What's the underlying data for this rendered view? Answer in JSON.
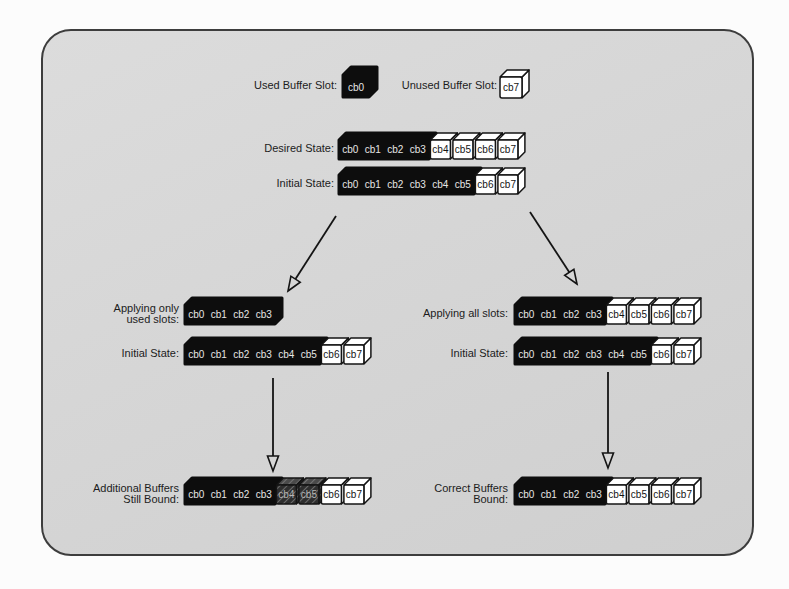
{
  "legend": {
    "used_label": "Used Buffer Slot:",
    "used_slot": "cb0",
    "unused_label": "Unused Buffer Slot:",
    "unused_slot": "cb7"
  },
  "rows": [
    {
      "id": "desired-state",
      "label_lines": [
        "Desired State:"
      ],
      "segments": [
        {
          "type": "used",
          "slots": [
            "cb0",
            "cb1",
            "cb2",
            "cb3"
          ]
        },
        {
          "type": "unused",
          "slots": [
            "cb4",
            "cb5",
            "cb6",
            "cb7"
          ]
        }
      ]
    },
    {
      "id": "initial-state-top",
      "label_lines": [
        "Initial State:"
      ],
      "segments": [
        {
          "type": "used",
          "slots": [
            "cb0",
            "cb1",
            "cb2",
            "cb3",
            "cb4",
            "cb5"
          ]
        },
        {
          "type": "unused",
          "slots": [
            "cb6",
            "cb7"
          ]
        }
      ]
    },
    {
      "id": "applying-only-used",
      "label_lines": [
        "Applying only",
        "used slots:"
      ],
      "segments": [
        {
          "type": "used",
          "slots": [
            "cb0",
            "cb1",
            "cb2",
            "cb3"
          ]
        }
      ]
    },
    {
      "id": "initial-state-left",
      "label_lines": [
        "Initial State:"
      ],
      "segments": [
        {
          "type": "used",
          "slots": [
            "cb0",
            "cb1",
            "cb2",
            "cb3",
            "cb4",
            "cb5"
          ]
        },
        {
          "type": "unused",
          "slots": [
            "cb6",
            "cb7"
          ]
        }
      ]
    },
    {
      "id": "additional-buffers-still-bound",
      "label_lines": [
        "Additional Buffers",
        "Still Bound:"
      ],
      "segments": [
        {
          "type": "used",
          "slots": [
            "cb0",
            "cb1",
            "cb2",
            "cb3"
          ]
        },
        {
          "type": "hatched",
          "slots": [
            "cb4",
            "cb5"
          ]
        },
        {
          "type": "unused",
          "slots": [
            "cb6",
            "cb7"
          ]
        }
      ]
    },
    {
      "id": "applying-all-slots",
      "label_lines": [
        "Applying all slots:"
      ],
      "segments": [
        {
          "type": "used",
          "slots": [
            "cb0",
            "cb1",
            "cb2",
            "cb3"
          ]
        },
        {
          "type": "unused",
          "slots": [
            "cb4",
            "cb5",
            "cb6",
            "cb7"
          ]
        }
      ]
    },
    {
      "id": "initial-state-right",
      "label_lines": [
        "Initial State:"
      ],
      "segments": [
        {
          "type": "used",
          "slots": [
            "cb0",
            "cb1",
            "cb2",
            "cb3",
            "cb4",
            "cb5"
          ]
        },
        {
          "type": "unused",
          "slots": [
            "cb6",
            "cb7"
          ]
        }
      ]
    },
    {
      "id": "correct-buffers-bound",
      "label_lines": [
        "Correct Buffers",
        "Bound:"
      ],
      "segments": [
        {
          "type": "used",
          "slots": [
            "cb0",
            "cb1",
            "cb2",
            "cb3"
          ]
        },
        {
          "type": "unused",
          "slots": [
            "cb4",
            "cb5",
            "cb6",
            "cb7"
          ]
        }
      ]
    }
  ],
  "colors": {
    "panel_bg": "#d6d6d6",
    "panel_border": "#3d3d3d",
    "used_fill": "#0d0d0d",
    "used_text": "#e6e6e6",
    "unused_fill": "#ffffff",
    "unused_text": "#141414",
    "outline": "#141414",
    "hatched_front": "#2e2e2e",
    "hatched_top": "#4a4a4a",
    "hatch_line": "#8a8a8a",
    "hatched_text": "#b5b5b5",
    "arrow": "#141414"
  }
}
